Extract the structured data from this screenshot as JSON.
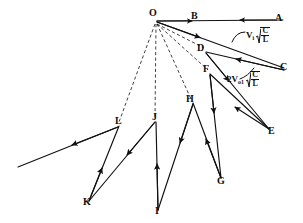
{
  "figure": {
    "type": "lattice-reflection-diagram",
    "canvas": {
      "width": 303,
      "height": 223
    },
    "stroke_color": "#101010",
    "dash_color": "#202020"
  },
  "nodes": [
    {
      "id": "A",
      "label": "A",
      "x": 281,
      "y": 20,
      "label_x": 277,
      "label_y": 14
    },
    {
      "id": "B",
      "label": "B",
      "x": 196,
      "y": 20,
      "label_x": 192,
      "label_y": 12
    },
    {
      "id": "C",
      "label": "C",
      "x": 283,
      "y": 69,
      "label_x": 280,
      "label_y": 63
    },
    {
      "id": "D",
      "label": "D",
      "x": 205,
      "y": 50,
      "label_x": 198,
      "label_y": 45
    },
    {
      "id": "E",
      "label": "E",
      "x": 268,
      "y": 131,
      "label_x": 268,
      "label_y": 127
    },
    {
      "id": "F",
      "label": "F",
      "x": 209,
      "y": 72,
      "label_x": 205,
      "label_y": 66
    },
    {
      "id": "G",
      "label": "G",
      "x": 220,
      "y": 180,
      "label_x": 216,
      "label_y": 176
    },
    {
      "id": "H",
      "label": "H",
      "x": 192,
      "y": 101,
      "label_x": 188,
      "label_y": 95
    },
    {
      "id": "I",
      "label": "I",
      "x": 157,
      "y": 212,
      "label_x": 155,
      "label_y": 206
    },
    {
      "id": "J",
      "label": "J",
      "x": 155,
      "y": 120,
      "label_x": 152,
      "label_y": 114
    },
    {
      "id": "K",
      "label": "K",
      "x": 88,
      "y": 203,
      "label_x": 84,
      "label_y": 197
    },
    {
      "id": "L",
      "label": "L",
      "x": 118,
      "y": 124,
      "label_x": 116,
      "label_y": 118
    },
    {
      "id": "O",
      "label": "O",
      "x": 156,
      "y": 22,
      "label_x": 150,
      "label_y": 9
    }
  ],
  "annotations": [
    {
      "id": "annot-vi",
      "coefficient": "",
      "symbol": "V",
      "subscript": "i",
      "radicand_numerator": "C",
      "radicand_denominator": "L",
      "text": "Vi sqrt(C/L)",
      "x": 246,
      "y": 30
    },
    {
      "id": "annot-2vo1",
      "coefficient": "2",
      "symbol": "V",
      "subscript": "o1",
      "radicand_numerator": "C",
      "radicand_denominator": "L",
      "text": "2Vo1 sqrt(C/L)",
      "x": 227,
      "y": 74
    }
  ],
  "solid_paths": [
    {
      "id": "O-to-B",
      "from": "O",
      "to": "B",
      "arrow": "forward"
    },
    {
      "id": "A-to-B",
      "from": "A",
      "to": "B",
      "arrow": "forward"
    },
    {
      "id": "O-to-C",
      "from": "O",
      "to": "C",
      "arrow": "mid-forward"
    },
    {
      "id": "C-to-D",
      "from": "C",
      "to": "D",
      "arrow": "mid-forward"
    },
    {
      "id": "D-to-E",
      "from": "D",
      "to": "E",
      "arrow": "mid-forward"
    },
    {
      "id": "E-to-F",
      "from": "E",
      "to": "F",
      "arrow": "mid-forward"
    },
    {
      "id": "F-to-G",
      "from": "F",
      "to": "G",
      "arrow": "mid-forward"
    },
    {
      "id": "G-to-H",
      "from": "G",
      "to": "H",
      "arrow": "mid-forward"
    },
    {
      "id": "H-to-I",
      "from": "H",
      "to": "I",
      "arrow": "mid-forward"
    },
    {
      "id": "I-to-J",
      "from": "I",
      "to": "J",
      "arrow": "mid-forward"
    },
    {
      "id": "J-to-K",
      "from": "J",
      "to": "K",
      "arrow": "mid-forward"
    },
    {
      "id": "K-to-L",
      "from": "K",
      "to": "L",
      "arrow": "mid-forward"
    },
    {
      "id": "L-to-tail",
      "from": "L",
      "to": "tail",
      "arrow": "mid-forward"
    }
  ],
  "dashed_rays": [
    {
      "id": "O-to-D",
      "from": "O",
      "to": "D"
    },
    {
      "id": "O-to-F",
      "from": "O",
      "to": "F"
    },
    {
      "id": "O-to-H",
      "from": "O",
      "to": "H"
    },
    {
      "id": "O-to-J",
      "from": "O",
      "to": "J"
    },
    {
      "id": "O-to-L",
      "from": "O",
      "to": "L"
    }
  ]
}
